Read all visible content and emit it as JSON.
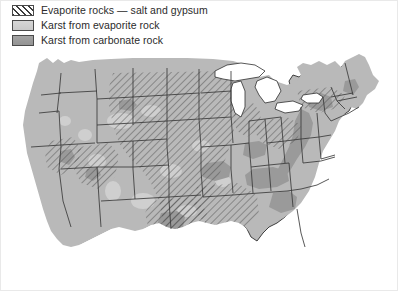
{
  "figure": {
    "kind": "thematic-map",
    "region": "contiguous-united-states",
    "title": ""
  },
  "legend": {
    "position": "top-left",
    "items": [
      {
        "key": "evaporite_rocks",
        "label": "Evaporite rocks — salt and gypsum",
        "swatch": "diagonal-hatch",
        "swatch_fill": "#ffffff",
        "swatch_line": "#3c3c3c",
        "swatch_border": "#4a4a4a"
      },
      {
        "key": "karst_evaporite",
        "label": "Karst from evaporite rock",
        "swatch": "solid-light-gray",
        "swatch_fill": "#cfcfcf",
        "swatch_border": "#4a4a4a"
      },
      {
        "key": "karst_carbonate",
        "label": "Karst from carbonate rock",
        "swatch": "solid-dark-gray",
        "swatch_fill": "#9c9c9c",
        "swatch_border": "#4a4a4a"
      }
    ]
  },
  "map": {
    "land_fill": "#b9b9b9",
    "water_fill": "#ffffff",
    "state_border": "#3a3a3a",
    "coast_border": "#2e2e2e",
    "karst_carbonate_fill": "#9a9a9a",
    "karst_evaporite_fill": "#cfcfcf",
    "hatch_line": "#4a4a4a",
    "hatch_angle_deg": 45,
    "hatch_spacing_px": 5,
    "water_bodies": [
      "Lake Superior",
      "Lake Michigan",
      "Lake Huron",
      "Lake Erie",
      "Lake Ontario"
    ],
    "hatched_regions": [
      "Montana",
      "North Dakota",
      "South Dakota",
      "Wyoming",
      "Colorado",
      "Kansas",
      "Oklahoma",
      "Texas",
      "New Mexico",
      "Nebraska",
      "Michigan",
      "Ohio",
      "Indiana",
      "Arkansas",
      "Louisiana",
      "Mississippi",
      "Alabama",
      "Florida",
      "New York",
      "Pennsylvania",
      "Utah",
      "Arizona",
      "Nevada"
    ],
    "carbonate_karst_regions": [
      "Kentucky",
      "Tennessee",
      "Virginia",
      "West Virginia",
      "Missouri",
      "Indiana",
      "Florida",
      "Pennsylvania",
      "Alabama",
      "Texas Edwards Plateau",
      "Appalachian Valley and Ridge"
    ]
  }
}
